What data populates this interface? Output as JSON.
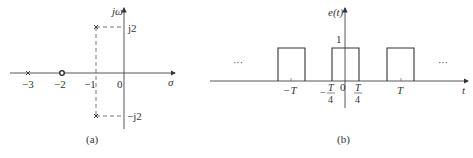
{
  "figure_a": {
    "caption": "(a)",
    "axes": {
      "horizontal_label": "σ",
      "vertical_label": "jω",
      "origin_label": "0"
    },
    "ticks": [
      {
        "label": "−3",
        "value": -3
      },
      {
        "label": "−2",
        "value": -2
      },
      {
        "label": "−1",
        "value": -1
      }
    ],
    "imag_labels": {
      "upper": "j2",
      "lower": "−j2"
    },
    "poles": [
      {
        "re": -3,
        "im": 0
      },
      {
        "re": -1,
        "im": 2
      },
      {
        "re": -1,
        "im": -2
      }
    ],
    "zeros": [
      {
        "re": -2,
        "im": 0
      }
    ]
  },
  "figure_b": {
    "caption": "(b)",
    "axes": {
      "horizontal_label": "t",
      "vertical_label": "e(t)",
      "origin_label": "0"
    },
    "amplitude_label": "1",
    "tick_labels": {
      "neg_T": "−T",
      "pos_T": "T",
      "T_num": "T",
      "four": "4",
      "minus": "−"
    },
    "ellipsis_left": "···",
    "ellipsis_right": "···",
    "pulses": [
      {
        "center": "-T",
        "width": "T/2"
      },
      {
        "center": "0",
        "width": "T/2"
      },
      {
        "center": "T",
        "width": "T/2"
      }
    ]
  }
}
